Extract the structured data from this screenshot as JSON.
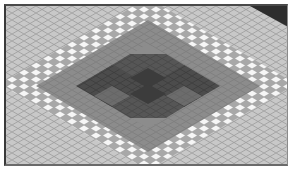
{
  "map_preview": {
    "description": "Isometric tile grid map preview",
    "colors": {
      "base_tile": "#c8c8c8",
      "grid_line": "#9a9a9a",
      "highlight_band": "#f4f4f4",
      "mid_region": "#8e8e8e",
      "dark_region": "#4a4a4a",
      "darkest_corner": "#2e2e2e",
      "border": "#3a3a3a"
    },
    "regions": [
      {
        "name": "outer-ground",
        "shade": "light-gray"
      },
      {
        "name": "highlight-ring",
        "shade": "white"
      },
      {
        "name": "mid-diamond",
        "shade": "medium-gray"
      },
      {
        "name": "center-cross",
        "shade": "dark-gray"
      },
      {
        "name": "corner-shadow",
        "shade": "black"
      }
    ]
  }
}
